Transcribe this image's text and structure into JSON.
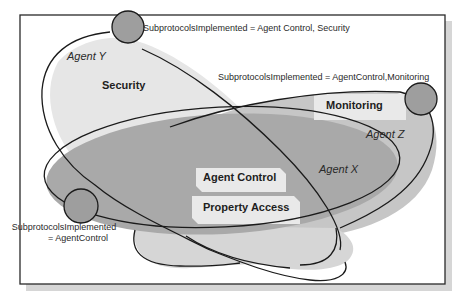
{
  "diagram": {
    "colors": {
      "frame": "#2a2a2a",
      "shadow": "#d6d6d6",
      "agent_x_fill": "#a9a9a9",
      "agent_y_fill": "#e6e6e6",
      "agent_z_fill": "#c6c6c6",
      "lower_lobe_fill": "#d2d2d2",
      "proto_box_fill": "#e9e9e9",
      "node_fill": "#9e9e9e",
      "outline": "#1a1a1a"
    },
    "agents": [
      {
        "id": "agent-x",
        "label": "Agent X"
      },
      {
        "id": "agent-y",
        "label": "Agent Y"
      },
      {
        "id": "agent-z",
        "label": "Agent Z"
      }
    ],
    "subprotocols": [
      {
        "id": "security",
        "label": "Security"
      },
      {
        "id": "monitoring",
        "label": "Monitoring"
      },
      {
        "id": "agent-control",
        "label": "Agent Control"
      },
      {
        "id": "property-access",
        "label": "Property Access"
      }
    ],
    "annotations": [
      {
        "id": "anno-agent-y",
        "text": "SubprotocolsImplemented = Agent Control, Security"
      },
      {
        "id": "anno-agent-z",
        "text": "SubprotocolsImplemented = AgentControl,Monitoring"
      },
      {
        "id": "anno-agent-x-line1",
        "text": "SubprotocolsImplemented"
      },
      {
        "id": "anno-agent-x-line2",
        "text": "= AgentControl"
      }
    ]
  }
}
